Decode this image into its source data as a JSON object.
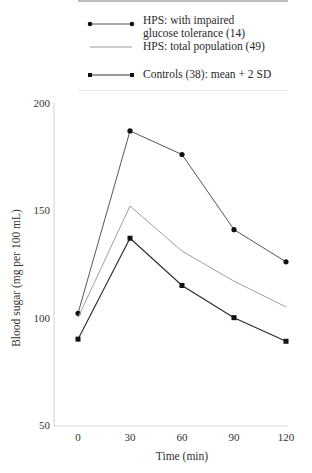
{
  "legend": {
    "items": [
      {
        "label_line1": "HPS: with impaired",
        "label_line2": "glucose tolerance (14)",
        "marker": "circle",
        "color": "#555555"
      },
      {
        "label_line1": "HPS: total population (49)",
        "marker": "none",
        "color": "#9a9a9a"
      },
      {
        "label_line1": "Controls (38): mean + 2 SD",
        "marker": "square",
        "color": "#333333"
      }
    ]
  },
  "chart_data": {
    "type": "line",
    "title": "",
    "xlabel": "Time (min)",
    "ylabel": "Blood sugar (mg per 100 mL)",
    "x": [
      0,
      30,
      60,
      90,
      120
    ],
    "xticks": [
      "0",
      "30",
      "60",
      "90",
      "120"
    ],
    "yticks": [
      "50",
      "100",
      "150",
      "200"
    ],
    "ylim": [
      50,
      200
    ],
    "grid": false,
    "legend_position": "top",
    "series": [
      {
        "name": "HPS: with impaired glucose tolerance (14)",
        "marker": "circle",
        "values": [
          102,
          187,
          176,
          141,
          126
        ]
      },
      {
        "name": "HPS: total population (49)",
        "marker": "none",
        "values": [
          100,
          152,
          131,
          117,
          105
        ]
      },
      {
        "name": "Controls (38): mean + 2 SD",
        "marker": "square",
        "values": [
          90,
          137,
          115,
          100,
          89
        ]
      }
    ]
  }
}
